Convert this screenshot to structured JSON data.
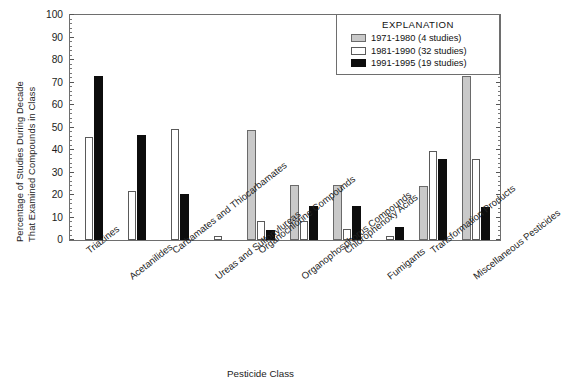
{
  "chart_data": {
    "type": "bar",
    "title": "",
    "xlabel": "Pesticide Class",
    "ylabel": "Percentage of Studies During Decade That Examined Compounds in Class",
    "ylabel_lines": [
      "Percentage of Studies During Decade",
      "That Examined Compounds in Class"
    ],
    "ylim": [
      0,
      100
    ],
    "ytick_labels": [
      "0",
      "10",
      "20",
      "30",
      "40",
      "50",
      "60",
      "70",
      "80",
      "90",
      "100"
    ],
    "ytick_values": [
      0,
      10,
      20,
      30,
      40,
      50,
      60,
      70,
      80,
      90,
      100
    ],
    "yminor_step": 2,
    "grid": false,
    "legend_position": "top-right",
    "legend_title": "EXPLANATION",
    "categories": [
      "Triazines",
      "Acetanilides",
      "Carbamates and Thiocarbamates",
      "Ureas and Sulfonylureas",
      "Organochlorine Compounds",
      "Organophosphorus Compounds",
      "Chlorophenoxy Acids",
      "Fumigants",
      "Transformation Products",
      "Miscellaneous Pesticides"
    ],
    "series": [
      {
        "name": "1971-1980 (4 studies)",
        "label": "1971-1980 (4 studies)",
        "color": "#c9c9c9",
        "values": [
          0,
          0,
          0,
          0,
          49,
          24.5,
          24.5,
          0,
          24,
          73
        ]
      },
      {
        "name": "1981-1990 (32 studies)",
        "label": "1981-1990 (32 studies)",
        "color": "#ffffff",
        "values": [
          46,
          22,
          49.5,
          2,
          8.5,
          8.5,
          5,
          2,
          39.5,
          36
        ]
      },
      {
        "name": "1991-1995 (19 studies)",
        "label": "1991-1995 (19 studies)",
        "color": "#0d0d0d",
        "values": [
          73,
          46.5,
          20.5,
          0,
          4.5,
          15,
          15,
          6,
          36,
          14.5
        ]
      }
    ]
  },
  "xaxis": {
    "title": "Pesticide Class"
  },
  "legend": {
    "title": "EXPLANATION",
    "entries": [
      {
        "label": "1971-1980 (4 studies)",
        "swatch": "gray-swatch"
      },
      {
        "label": "1981-1990 (32 studies)",
        "swatch": "white-swatch"
      },
      {
        "label": "1991-1995 (19 studies)",
        "swatch": "black-swatch"
      }
    ]
  }
}
